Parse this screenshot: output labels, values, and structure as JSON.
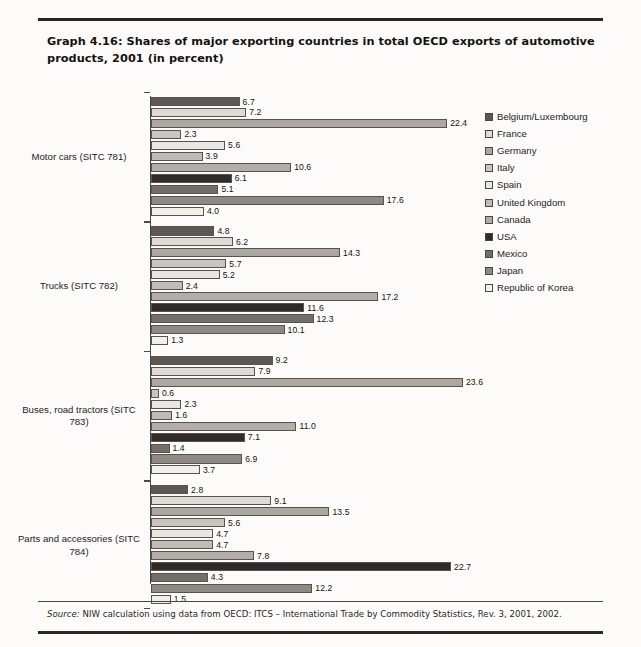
{
  "figure": {
    "title": "Graph 4.16: Shares of major exporting countries in total OECD exports of automotive products, 2001 (in percent)",
    "source_prefix": "Source:",
    "source_text": " NIW calculation using data from OECD: ITCS – International Trade by Commodity Statistics, Rev. 3, 2001, 2002."
  },
  "chart_data": {
    "type": "bar",
    "orientation": "horizontal",
    "title": "Graph 4.16: Shares of major exporting countries in total OECD exports of automotive products, 2001 (in percent)",
    "xlabel": "",
    "ylabel": "",
    "xlim": [
      0,
      24
    ],
    "grid": false,
    "legend_position": "right",
    "value_labels": true,
    "categories": [
      "Motor cars (SITC 781)",
      "Trucks (SITC 782)",
      "Buses, road tractors (SITC 783)",
      "Parts and accessories (SITC 784)"
    ],
    "series": [
      {
        "name": "Belgium/Luxembourg",
        "color": "#5c5955",
        "values": [
          6.7,
          4.8,
          9.2,
          2.8
        ]
      },
      {
        "name": "France",
        "color": "#dedbd6",
        "values": [
          7.2,
          6.2,
          7.9,
          9.1
        ]
      },
      {
        "name": "Germany",
        "color": "#aba8a3",
        "values": [
          22.4,
          14.3,
          23.6,
          13.5
        ]
      },
      {
        "name": "Italy",
        "color": "#c9c6c1",
        "values": [
          2.3,
          5.7,
          0.6,
          5.6
        ]
      },
      {
        "name": "Spain",
        "color": "#e9e7e3",
        "values": [
          5.6,
          5.2,
          2.3,
          4.7
        ]
      },
      {
        "name": "United Kingdom",
        "color": "#bfbcb7",
        "values": [
          3.9,
          2.4,
          1.6,
          4.7
        ]
      },
      {
        "name": "Canada",
        "color": "#b2afaa",
        "values": [
          10.6,
          17.2,
          11.0,
          7.8
        ]
      },
      {
        "name": "USA",
        "color": "#2e2b28",
        "values": [
          6.1,
          11.6,
          7.1,
          22.7
        ]
      },
      {
        "name": "Mexico",
        "color": "#726f6a",
        "values": [
          5.1,
          12.3,
          1.4,
          4.3
        ]
      },
      {
        "name": "Japan",
        "color": "#8d8a85",
        "values": [
          17.6,
          10.1,
          6.9,
          12.2
        ]
      },
      {
        "name": "Republic of Korea",
        "color": "#f2f0ec",
        "values": [
          4.0,
          1.3,
          3.7,
          1.5
        ]
      }
    ]
  }
}
